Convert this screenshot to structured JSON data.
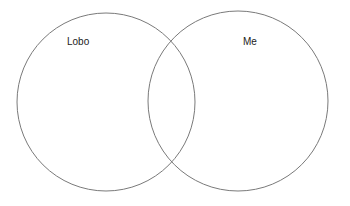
{
  "diagram": {
    "type": "venn",
    "stroke_color": "#7a7a7a",
    "sets": [
      {
        "label": "Lobo",
        "cx": 106,
        "cy": 102,
        "r": 89,
        "label_x": 67,
        "label_y": 45
      },
      {
        "label": "Me",
        "cx": 238,
        "cy": 101,
        "r": 90,
        "label_x": 243,
        "label_y": 45
      }
    ]
  }
}
